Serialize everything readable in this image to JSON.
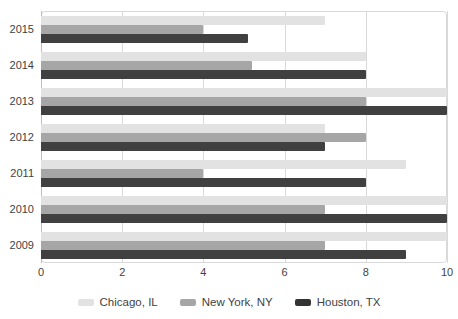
{
  "title_sliver": {
    "text": "",
    "note": "title row is cropped off at the top edge of the screenshot and is not legible"
  },
  "colors": {
    "series_chicago": "#e2e2e2",
    "series_newyork": "#a6a6a6",
    "series_houston": "#404040",
    "gridline": "#d9d9d9",
    "axis": "#bfbfbf",
    "text": "#3f3f3f",
    "background": "#ffffff"
  },
  "legend": {
    "position": "bottom-center",
    "items": [
      {
        "label": "Chicago, IL",
        "swatch": "#e2e2e2"
      },
      {
        "label": "New York, NY",
        "swatch": "#a6a6a6"
      },
      {
        "label": "Houston, TX",
        "swatch": "#333333"
      }
    ]
  },
  "axis": {
    "x_ticks": [
      "0",
      "2",
      "4",
      "6",
      "8",
      "10"
    ],
    "y_categories": [
      "2015",
      "2014",
      "2013",
      "2012",
      "2011",
      "2010",
      "2009"
    ]
  },
  "chart_data": {
    "type": "bar",
    "orientation": "horizontal",
    "title": "",
    "xlabel": "",
    "ylabel": "",
    "xlim": [
      0,
      10
    ],
    "grid": "vertical-only",
    "legend_position": "bottom-center",
    "categories": [
      "2015",
      "2014",
      "2013",
      "2012",
      "2011",
      "2010",
      "2009"
    ],
    "series": [
      {
        "name": "Chicago, IL",
        "color": "#e2e2e2",
        "values": [
          7,
          8,
          10,
          7,
          9,
          10,
          10
        ]
      },
      {
        "name": "New York, NY",
        "color": "#a6a6a6",
        "values": [
          4,
          5.2,
          8,
          8,
          4,
          7,
          7
        ]
      },
      {
        "name": "Houston, TX",
        "color": "#404040",
        "values": [
          5.1,
          8,
          10,
          7,
          8,
          10,
          9
        ]
      }
    ]
  }
}
